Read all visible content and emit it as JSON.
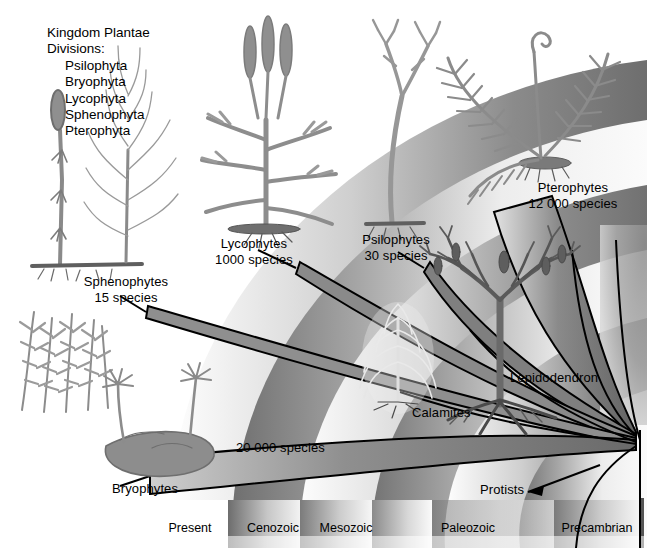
{
  "figure": {
    "title_block": {
      "line1": "Kingdom Plantae",
      "line2": "Divisions:",
      "divisions": [
        "Psilophyta",
        "Bryophyta",
        "Lycophyta",
        "Sphenophyta",
        "Pterophyta"
      ]
    },
    "groups": [
      {
        "name": "Sphenophytes",
        "count": "15 species"
      },
      {
        "name": "Lycophytes",
        "count": "1000 species"
      },
      {
        "name": "Psilophytes",
        "count": "30 species"
      },
      {
        "name": "Pterophytes",
        "count": "12 000 species"
      },
      {
        "name": "Bryophytes",
        "count": "20 000 species"
      }
    ],
    "fossil_labels": [
      "Calamites",
      "Lepidodendron"
    ],
    "origin_label": "Protists",
    "timeline": {
      "present_label": "Present",
      "eras": [
        "Cenozoic",
        "Mesozoic",
        "Paleozoic",
        "Precambrian"
      ]
    },
    "colors": {
      "background": "#ffffff",
      "ink": "#000000",
      "wedge_dark": "#6e6e6e",
      "wedge_mid": "#8c8c8c",
      "wedge_light": "#bdbdbd",
      "band_dark": "#6b6b6b",
      "band_light": "#e9e9e9"
    }
  }
}
